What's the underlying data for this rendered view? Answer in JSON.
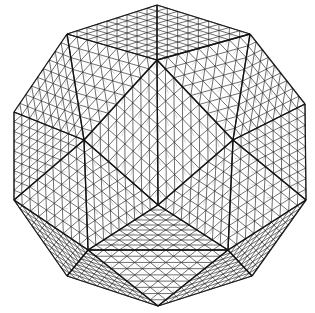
{
  "diagram": {
    "type": "geodesic-wireframe-polyhedron",
    "colors": {
      "background": "#ffffff",
      "strut": "#2a2a2a",
      "edge": "#111111"
    },
    "subdivision": 9,
    "silhouette": [
      [
        157,
        5
      ],
      [
        250,
        34
      ],
      [
        305,
        104
      ],
      [
        306,
        200
      ],
      [
        252,
        276
      ],
      [
        158,
        306
      ],
      [
        67,
        276
      ],
      [
        14,
        200
      ],
      [
        14,
        112
      ],
      [
        67,
        34
      ]
    ],
    "center_front": [
      158,
      205
    ],
    "inner_ring": [
      [
        157,
        60
      ],
      [
        233,
        140
      ],
      [
        228,
        250
      ],
      [
        88,
        250
      ],
      [
        84,
        140
      ]
    ],
    "faces": [
      [
        [
          157,
          5
        ],
        [
          250,
          34
        ],
        [
          157,
          60
        ]
      ],
      [
        [
          157,
          5
        ],
        [
          67,
          34
        ],
        [
          157,
          60
        ]
      ],
      [
        [
          250,
          34
        ],
        [
          233,
          140
        ],
        [
          157,
          60
        ]
      ],
      [
        [
          67,
          34
        ],
        [
          84,
          140
        ],
        [
          157,
          60
        ]
      ],
      [
        [
          250,
          34
        ],
        [
          305,
          104
        ],
        [
          233,
          140
        ]
      ],
      [
        [
          67,
          34
        ],
        [
          14,
          112
        ],
        [
          84,
          140
        ]
      ],
      [
        [
          305,
          104
        ],
        [
          306,
          200
        ],
        [
          233,
          140
        ]
      ],
      [
        [
          14,
          112
        ],
        [
          14,
          200
        ],
        [
          84,
          140
        ]
      ],
      [
        [
          306,
          200
        ],
        [
          228,
          250
        ],
        [
          233,
          140
        ]
      ],
      [
        [
          14,
          200
        ],
        [
          88,
          250
        ],
        [
          84,
          140
        ]
      ],
      [
        [
          306,
          200
        ],
        [
          252,
          276
        ],
        [
          228,
          250
        ]
      ],
      [
        [
          14,
          200
        ],
        [
          67,
          276
        ],
        [
          88,
          250
        ]
      ],
      [
        [
          252,
          276
        ],
        [
          158,
          306
        ],
        [
          228,
          250
        ]
      ],
      [
        [
          67,
          276
        ],
        [
          158,
          306
        ],
        [
          88,
          250
        ]
      ],
      [
        [
          158,
          306
        ],
        [
          88,
          250
        ],
        [
          228,
          250
        ]
      ],
      [
        [
          157,
          60
        ],
        [
          233,
          140
        ],
        [
          158,
          205
        ]
      ],
      [
        [
          157,
          60
        ],
        [
          84,
          140
        ],
        [
          158,
          205
        ]
      ],
      [
        [
          233,
          140
        ],
        [
          228,
          250
        ],
        [
          158,
          205
        ]
      ],
      [
        [
          84,
          140
        ],
        [
          88,
          250
        ],
        [
          158,
          205
        ]
      ],
      [
        [
          88,
          250
        ],
        [
          228,
          250
        ],
        [
          158,
          205
        ]
      ]
    ]
  }
}
